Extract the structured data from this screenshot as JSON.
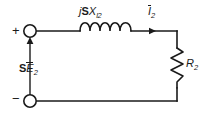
{
  "figure": {
    "background_color": "#ffffff",
    "line_color": "#1a1a1a",
    "width": 208,
    "height": 119
  },
  "terminals": {
    "positive_mark": "+",
    "negative_mark": "−",
    "positive_name": "positive-terminal",
    "negative_name": "negative-terminal"
  },
  "source": {
    "prefix": "S",
    "symbol": "E",
    "subscript": "2",
    "full_label": "SĒ₂",
    "arrow_direction": "up"
  },
  "reactance": {
    "imaginary": "j",
    "slip": "S",
    "symbol": "X",
    "subscript": "l2",
    "full_label": "jSXₗ₂",
    "coil_turns": 5
  },
  "current": {
    "symbol": "I",
    "subscript": "2",
    "full_label": "Ī₂",
    "arrow_direction": "right"
  },
  "resistor": {
    "symbol": "R",
    "subscript": "2",
    "full_label": "R₂",
    "orientation": "vertical",
    "zigzag_segments": 6
  }
}
